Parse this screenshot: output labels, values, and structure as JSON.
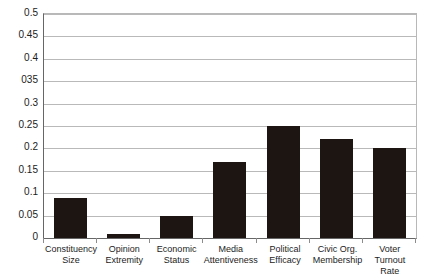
{
  "chart_data": {
    "type": "bar",
    "title": "",
    "xlabel": "",
    "ylabel": "",
    "ylim": [
      0,
      0.5
    ],
    "grid": true,
    "legend": false,
    "bar_color": "#1d1512",
    "gridline_color": "#b9b9b9",
    "axis_color": "#666666",
    "categories": [
      "Constituency Size",
      "Opinion Extremity",
      "Economic Status",
      "Media Attentiveness",
      "Political Efficacy",
      "Civic Org. Membership",
      "Voter Turnout Rate"
    ],
    "category_lines": [
      [
        "Constituency",
        "Size"
      ],
      [
        "Opinion",
        "Extremity"
      ],
      [
        "Economic",
        "Status"
      ],
      [
        "Media",
        "Attentiveness"
      ],
      [
        "Political",
        "Efficacy"
      ],
      [
        "Civic Org.",
        "Membership"
      ],
      [
        "Voter Turnout",
        "Rate"
      ]
    ],
    "values": [
      0.09,
      0.01,
      0.05,
      0.17,
      0.25,
      0.22,
      0.2
    ],
    "ytick_values": [
      0,
      0.05,
      0.1,
      0.15,
      0.2,
      0.25,
      0.3,
      0.35,
      0.4,
      0.45,
      0.5
    ],
    "ytick_labels": [
      "0",
      "0.05",
      "0.1",
      "0.15",
      "0.2",
      "0.25",
      "0.3",
      "035",
      "0.4",
      "0.45",
      "0.5"
    ]
  }
}
